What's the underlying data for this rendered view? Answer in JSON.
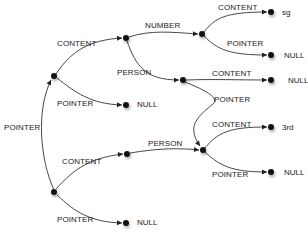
{
  "diagram": {
    "type": "pointer-graph",
    "nodes": [
      {
        "id": "root",
        "x": 54,
        "y": 192,
        "label": ""
      },
      {
        "id": "a",
        "x": 54,
        "y": 76,
        "label": ""
      },
      {
        "id": "b",
        "x": 126,
        "y": 38,
        "label": ""
      },
      {
        "id": "a_null",
        "x": 126,
        "y": 105,
        "label": "NULL"
      },
      {
        "id": "c",
        "x": 202,
        "y": 34,
        "label": ""
      },
      {
        "id": "c_sg",
        "x": 271,
        "y": 12,
        "label": "sg"
      },
      {
        "id": "c_null",
        "x": 271,
        "y": 55,
        "label": "NULL"
      },
      {
        "id": "d",
        "x": 183,
        "y": 80,
        "label": ""
      },
      {
        "id": "d_null",
        "x": 271,
        "y": 80,
        "label": "NULL"
      },
      {
        "id": "e",
        "x": 203,
        "y": 150,
        "label": ""
      },
      {
        "id": "e_3rd",
        "x": 271,
        "y": 127,
        "label": "3rd"
      },
      {
        "id": "e_null",
        "x": 271,
        "y": 172,
        "label": "NULL"
      },
      {
        "id": "f",
        "x": 127,
        "y": 154,
        "label": ""
      },
      {
        "id": "root_null",
        "x": 126,
        "y": 223,
        "label": "NULL"
      }
    ],
    "edges": [
      {
        "from": "root",
        "to": "a",
        "label": "POINTER",
        "lx": 4,
        "ly": 124
      },
      {
        "from": "a",
        "to": "b",
        "label": "CONTENT",
        "lx": 57,
        "ly": 41
      },
      {
        "from": "a",
        "to": "a_null",
        "label": "POINTER",
        "lx": 57,
        "ly": 100
      },
      {
        "from": "b",
        "to": "c",
        "label": "NUMBER",
        "lx": 145,
        "ly": 22
      },
      {
        "from": "b",
        "to": "d",
        "label": "PERSON",
        "lx": 117,
        "ly": 68
      },
      {
        "from": "c",
        "to": "c_sg",
        "label": "CONTENT",
        "lx": 218,
        "ly": 4
      },
      {
        "from": "c",
        "to": "c_null",
        "label": "POINTER",
        "lx": 227,
        "ly": 40
      },
      {
        "from": "d",
        "to": "d_null",
        "label": "CONTENT",
        "lx": 212,
        "ly": 70
      },
      {
        "from": "d",
        "to": "e",
        "label": "POINTER",
        "lx": 214,
        "ly": 97
      },
      {
        "from": "root",
        "to": "f",
        "label": "CONTENT",
        "lx": 62,
        "ly": 158
      },
      {
        "from": "root",
        "to": "root_null",
        "label": "POINTER",
        "lx": 57,
        "ly": 217
      },
      {
        "from": "f",
        "to": "e",
        "label": "PERSON",
        "lx": 148,
        "ly": 140
      },
      {
        "from": "e",
        "to": "e_3rd",
        "label": "CONTENT",
        "lx": 212,
        "ly": 121
      },
      {
        "from": "e",
        "to": "e_null",
        "label": "POINTER",
        "lx": 212,
        "ly": 171
      }
    ]
  },
  "labels": {
    "root_pointer": "POINTER",
    "a_content": "CONTENT",
    "a_pointer": "POINTER",
    "a_null": "NULL",
    "b_number": "NUMBER",
    "b_person": "PERSON",
    "c_content": "CONTENT",
    "c_pointer": "POINTER",
    "c_sg": "sg",
    "c_null": "NULL",
    "d_content": "CONTENT",
    "d_pointer": "POINTER",
    "d_null": "NULL",
    "root_content": "CONTENT",
    "root_pointer_bottom": "POINTER",
    "root_null": "NULL",
    "f_person": "PERSON",
    "e_content": "CONTENT",
    "e_pointer": "POINTER",
    "e_3rd": "3rd",
    "e_null": "NULL"
  },
  "colors": {
    "edge": "#333333",
    "node": "#111111",
    "text": "#222222",
    "background": "#ffffff"
  }
}
